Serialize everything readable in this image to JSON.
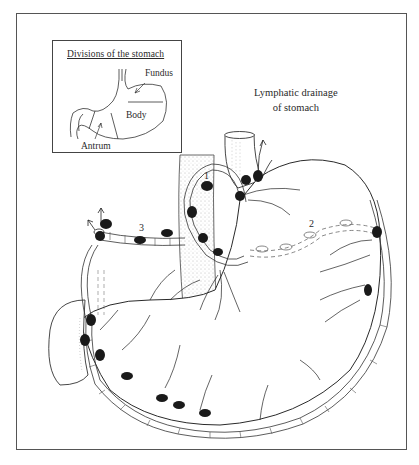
{
  "figure": {
    "title_line1": "Lymphatic drainage",
    "title_line2": "of stomach"
  },
  "inset": {
    "title": "Divisions of the stomach",
    "labels": {
      "fundus": "Fundus",
      "body": "Body",
      "antrum": "Antrum"
    }
  },
  "node_groups": [
    {
      "label": "1"
    },
    {
      "label": "2"
    },
    {
      "label": "3"
    }
  ],
  "colors": {
    "line": "#2a2a2a",
    "node": "#1a1a1a",
    "frame": "#555555",
    "background": "#ffffff"
  }
}
